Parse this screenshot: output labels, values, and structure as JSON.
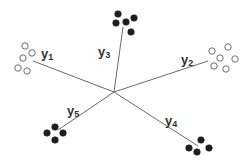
{
  "diagram": {
    "title": "",
    "center": {
      "x": 114,
      "y": 92
    },
    "colors": {
      "line": "#6a6a6a",
      "filled_dot": "#1e1e1e",
      "open_dot_stroke": "#6e6e6e",
      "label": "#333333",
      "background": "#ffffff"
    },
    "arms": [
      {
        "id": "y1",
        "label_main": "y",
        "label_sub": "1",
        "end": {
          "x": 33,
          "y": 61
        },
        "label_pos": {
          "x": 41,
          "y": 58
        },
        "dot_style": "open",
        "dots": [
          [
            25,
            46
          ],
          [
            32,
            53
          ],
          [
            23,
            58
          ],
          [
            18,
            68
          ],
          [
            27,
            71
          ]
        ]
      },
      {
        "id": "y2",
        "label_main": "y",
        "label_sub": "2",
        "end": {
          "x": 208,
          "y": 61
        },
        "label_pos": {
          "x": 181,
          "y": 64
        },
        "dot_style": "open",
        "dots": [
          [
            212,
            51
          ],
          [
            228,
            47
          ],
          [
            220,
            58
          ],
          [
            235,
            59
          ],
          [
            214,
            66
          ],
          [
            226,
            69
          ]
        ]
      },
      {
        "id": "y3",
        "label_main": "y",
        "label_sub": "3",
        "end": {
          "x": 123,
          "y": 27
        },
        "label_pos": {
          "x": 98,
          "y": 56
        },
        "dot_style": "filled",
        "dots": [
          [
            118,
            14
          ],
          [
            134,
            18
          ],
          [
            116,
            23
          ],
          [
            126,
            22
          ],
          [
            131,
            32
          ]
        ]
      },
      {
        "id": "y4",
        "label_main": "y",
        "label_sub": "4",
        "end": {
          "x": 198,
          "y": 146
        },
        "label_pos": {
          "x": 165,
          "y": 125
        },
        "dot_style": "filled",
        "dots": [
          [
            201,
            140
          ],
          [
            189,
            148
          ],
          [
            197,
            152
          ],
          [
            209,
            148
          ]
        ]
      },
      {
        "id": "y5",
        "label_main": "y",
        "label_sub": "5",
        "end": {
          "x": 58,
          "y": 130
        },
        "label_pos": {
          "x": 67,
          "y": 115
        },
        "dot_style": "filled",
        "dots": [
          [
            55,
            127
          ],
          [
            47,
            133
          ],
          [
            63,
            133
          ],
          [
            55,
            140
          ]
        ]
      }
    ]
  }
}
